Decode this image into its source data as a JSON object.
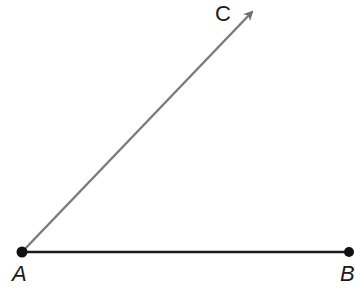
{
  "diagram": {
    "type": "angle",
    "points": {
      "A": {
        "label": "A",
        "x": 22,
        "y": 252
      },
      "B": {
        "label": "B",
        "x": 349,
        "y": 252
      },
      "C": {
        "label": "C",
        "x": 254,
        "y": 10
      }
    },
    "segments": [
      {
        "name": "ray-AC",
        "from": "A",
        "to": "C",
        "color": "#7a7a7a",
        "arrow": true
      },
      {
        "name": "segment-AB",
        "from": "A",
        "to": "B",
        "color": "#1a1a1a",
        "arrow": false
      }
    ]
  }
}
